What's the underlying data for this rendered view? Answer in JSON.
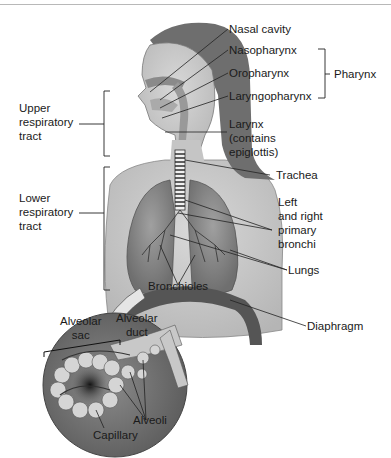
{
  "figure": {
    "labels": {
      "nasal_cavity": "Nasal cavity",
      "nasopharynx": "Nasopharynx",
      "oropharynx": "Oropharynx",
      "laryngopharynx": "Laryngopharynx",
      "pharynx": "Pharynx",
      "larynx": "Larynx\n(contains\nepiglottis)",
      "upper_tract": "Upper\nrespiratory\ntract",
      "lower_tract": "Lower\nrespiratory\ntract",
      "trachea": "Trachea",
      "primary_bronchi": "Left\nand right\nprimary\nbronchi",
      "lungs": "Lungs",
      "bronchioles": "Bronchioles",
      "diaphragm": "Diaphragm",
      "alveolar_sac": "Alveolar\nsac",
      "alveolar_duct": "Alveolar\nduct",
      "alveoli": "Alveoli",
      "capillary": "Capillary"
    },
    "colors": {
      "skin": "#c9c9c9",
      "hair": "#6e6e6e",
      "lung": "#8a8a8a",
      "diaphragm": "#555555",
      "inset_bg": "#7d7d7d",
      "leader": "#222222"
    }
  }
}
